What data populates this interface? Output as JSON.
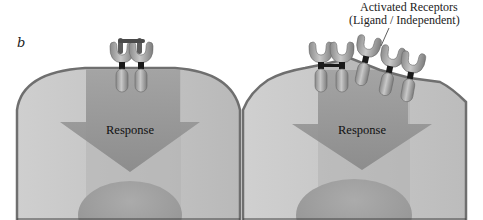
{
  "figure": {
    "panel_label": "b",
    "callout": {
      "line1": "Activated Receptors",
      "line2": "(Ligand / Independent)"
    },
    "cells": [
      {
        "id": "left",
        "state": "ligand-bound receptor dimer",
        "response_label": "Response",
        "receptor_count": 2
      },
      {
        "id": "right",
        "state": "overexpressed, ligand-independent activated receptors",
        "response_label": "Response",
        "receptor_count": 5
      }
    ]
  },
  "colors": {
    "cell_fill_light": "#c4c4c4",
    "cell_fill_mid": "#b3b3b3",
    "membrane": "#7a7a7a",
    "arrow": "#8f8f8f",
    "nucleus": "#9c9c9c",
    "receptor": "#a8a8a8",
    "receptor_dark": "#6e6e6e",
    "transmembrane": "#1a1a1a"
  }
}
